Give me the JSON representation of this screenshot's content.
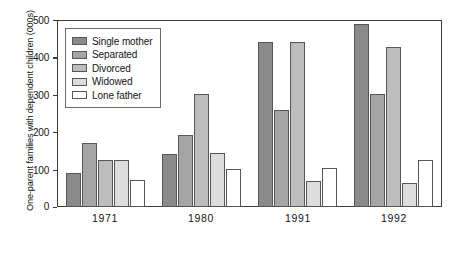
{
  "chart_data": {
    "type": "bar",
    "title": "",
    "xlabel": "",
    "ylabel": "One-parent families with dependent children (000s)",
    "categories": [
      "1971",
      "1980",
      "1991",
      "1992"
    ],
    "ylim": [
      0,
      500
    ],
    "yticks": [
      "0",
      "100",
      "200",
      "300",
      "400",
      "500"
    ],
    "grid": false,
    "legend_position": "top-left",
    "series": [
      {
        "name": "Single mother",
        "color": "#8a8a8a",
        "values": [
          90,
          143,
          440,
          490
        ]
      },
      {
        "name": "Separated",
        "color": "#a4a4a4",
        "values": [
          172,
          192,
          260,
          302
        ]
      },
      {
        "name": "Divorced",
        "color": "#bdbdbd",
        "values": [
          125,
          302,
          440,
          428
        ]
      },
      {
        "name": "Widowed",
        "color": "#dcdcdc",
        "values": [
          125,
          145,
          70,
          63
        ]
      },
      {
        "name": "Lone father",
        "color": "#ffffff",
        "values": [
          72,
          102,
          105,
          125
        ]
      }
    ]
  },
  "axis": {
    "frame_color": "#3a3a3a",
    "bar_edge_color": "#56565a",
    "legend_border_color": "#6a6a6a"
  }
}
